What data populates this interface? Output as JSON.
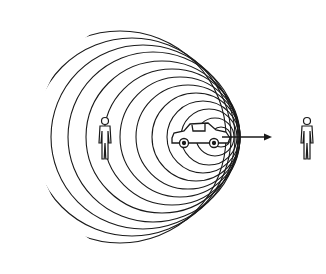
{
  "diagram": {
    "title": "Doppler effect: moving car emitting sound waves toward stationary observers",
    "colors": {
      "background": "#ffffff",
      "stroke": "#1a1a1a"
    },
    "clip_region": {
      "cx": 163,
      "cy": 137,
      "r": 126
    },
    "wavefronts": [
      {
        "cx": 120,
        "cy": 137,
        "r": 106
      },
      {
        "cx": 132,
        "cy": 137,
        "r": 99
      },
      {
        "cx": 143,
        "cy": 137,
        "r": 92
      },
      {
        "cx": 153,
        "cy": 137,
        "r": 85
      },
      {
        "cx": 162,
        "cy": 137,
        "r": 76
      },
      {
        "cx": 172,
        "cy": 137,
        "r": 68
      },
      {
        "cx": 180,
        "cy": 137,
        "r": 60
      },
      {
        "cx": 188,
        "cy": 137,
        "r": 52
      },
      {
        "cx": 196,
        "cy": 137,
        "r": 44
      },
      {
        "cx": 203,
        "cy": 137,
        "r": 36
      },
      {
        "cx": 209,
        "cy": 137,
        "r": 28
      },
      {
        "cx": 215,
        "cy": 137,
        "r": 19
      },
      {
        "cx": 221,
        "cy": 137,
        "r": 10
      }
    ],
    "source": {
      "label": "car",
      "x": 172,
      "y": 122,
      "w": 60,
      "h": 26
    },
    "velocity_arrow": {
      "x1": 222,
      "y1": 137,
      "x2": 272,
      "y2": 137
    },
    "observers": [
      {
        "label": "observer-left",
        "x": 105,
        "y": 121
      },
      {
        "label": "observer-right",
        "x": 307,
        "y": 121
      }
    ]
  }
}
